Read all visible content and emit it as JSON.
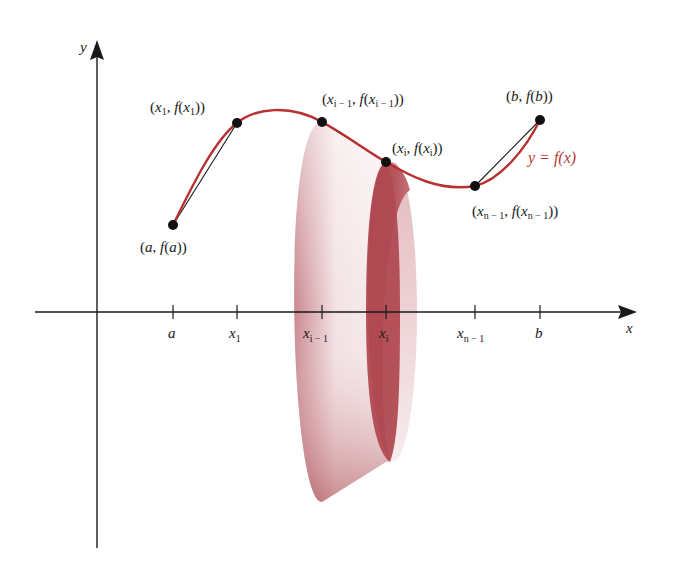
{
  "diagram": {
    "colors": {
      "curve": "#b8302f",
      "axis": "#1a1a1a",
      "point": "#111111",
      "frustum_dark": "#a8434a",
      "frustum_light": "#f5e6e8"
    },
    "axes": {
      "x_label": "x",
      "y_label": "y"
    },
    "ticks": [
      {
        "id": "a",
        "base": "a",
        "sub": ""
      },
      {
        "id": "x1",
        "base": "x",
        "sub": "1"
      },
      {
        "id": "xim1",
        "base": "x",
        "sub": "i − 1"
      },
      {
        "id": "xi",
        "base": "x",
        "sub": "i"
      },
      {
        "id": "xnm1",
        "base": "x",
        "sub": "n − 1"
      },
      {
        "id": "b",
        "base": "b",
        "sub": ""
      }
    ],
    "points": [
      {
        "id": "pa",
        "label_open": "(a, f(a))"
      },
      {
        "id": "px1",
        "label": "(x₁, f(x₁))"
      },
      {
        "id": "pxim1",
        "label": "(xᵢ₋₁, f(xᵢ₋₁))"
      },
      {
        "id": "pxi",
        "label": "(xᵢ, f(xᵢ))"
      },
      {
        "id": "pxnm1",
        "label": "(xₙ₋₁, f(xₙ₋₁))"
      },
      {
        "id": "pb",
        "label": "(b, f(b))"
      }
    ],
    "labels": {
      "pa": {
        "pre": "(",
        "v": "a",
        "mid": ", ",
        "f": "f",
        "open": "(",
        "v2": "a",
        "close": "))"
      },
      "px1": {
        "pre": "(",
        "v": "x",
        "sub": "1",
        "mid": ", ",
        "f": "f",
        "open": "(",
        "v2": "x",
        "sub2": "1",
        "close": "))"
      },
      "pxim1": {
        "pre": "(",
        "v": "x",
        "sub": "i − 1",
        "mid": ", ",
        "f": "f",
        "open": "(",
        "v2": "x",
        "sub2": "i − 1",
        "close": "))"
      },
      "pxi": {
        "pre": "(",
        "v": "x",
        "sub": "i",
        "mid": ", ",
        "f": "f",
        "open": "(",
        "v2": "x",
        "sub2": "i",
        "close": "))"
      },
      "pxnm1": {
        "pre": "(",
        "v": "x",
        "sub": "n − 1",
        "mid": ", ",
        "f": "f",
        "open": "(",
        "v2": "x",
        "sub2": "n − 1",
        "close": "))"
      },
      "pb": {
        "pre": "(",
        "v": "b",
        "mid": ", ",
        "f": "f",
        "open": "(",
        "v2": "b",
        "close": "))"
      }
    },
    "curve_label": "y = f(x)"
  }
}
